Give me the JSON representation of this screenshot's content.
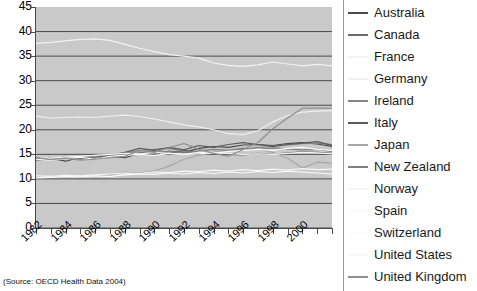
{
  "chart_data": {
    "type": "line",
    "title": "",
    "xlabel": "",
    "ylabel": "",
    "ylim": [
      0,
      45
    ],
    "ytick_step": 5,
    "yticks": [
      "0",
      "5",
      "10",
      "15",
      "20",
      "25",
      "30",
      "35",
      "40",
      "45"
    ],
    "grid": true,
    "grid_axis": "y",
    "plot_background": "#c9c9c9",
    "legend_position": "right",
    "x": [
      1982,
      1983,
      1984,
      1985,
      1986,
      1987,
      1988,
      1989,
      1990,
      1991,
      1992,
      1993,
      1994,
      1995,
      1996,
      1997,
      1998,
      1999,
      2000,
      2001,
      2002
    ],
    "xtick_labels": [
      "1982",
      "1984",
      "1986",
      "1988",
      "1990",
      "1992",
      "1994",
      "1996",
      "1998",
      "2000"
    ],
    "xtick_label_years": [
      1982,
      1984,
      1986,
      1988,
      1990,
      1992,
      1994,
      1996,
      1998,
      2000
    ],
    "xtick_label_rotation": -45,
    "series": [
      {
        "name": "Australia",
        "color": "#4a4a4a",
        "values": [
          14.0,
          14.2,
          13.6,
          14.4,
          14.1,
          14.6,
          14.3,
          15.2,
          15.0,
          15.6,
          15.4,
          16.2,
          16.6,
          16.4,
          16.9,
          17.0,
          16.8,
          17.2,
          17.4,
          17.1,
          16.6
        ]
      },
      {
        "name": "Canada",
        "color": "#6b6b6b",
        "values": [
          13.9,
          14.0,
          14.2,
          14.5,
          14.6,
          14.8,
          15.1,
          15.3,
          15.6,
          15.2,
          15.8,
          15.4,
          15.1,
          15.0,
          14.9,
          15.2,
          15.0,
          15.3,
          15.5,
          15.4,
          15.2
        ]
      },
      {
        "name": "France",
        "color": "#f2f2f2",
        "values": [
          37.6,
          37.8,
          38.1,
          38.4,
          38.5,
          38.2,
          37.4,
          36.6,
          35.9,
          35.3,
          35.0,
          34.6,
          33.6,
          33.1,
          32.9,
          33.2,
          33.8,
          33.4,
          33.0,
          33.3,
          33.0
        ]
      },
      {
        "name": "Germany",
        "color": "#efefef",
        "values": [
          22.8,
          22.4,
          22.5,
          22.6,
          22.5,
          22.8,
          23.0,
          22.7,
          22.2,
          21.6,
          21.0,
          20.6,
          20.0,
          19.2,
          19.0,
          19.8,
          21.6,
          22.9,
          23.6,
          23.8,
          23.9
        ]
      },
      {
        "name": "Ireland",
        "color": "#858585",
        "values": [
          14.2,
          14.0,
          14.6,
          14.4,
          14.8,
          15.0,
          15.3,
          15.7,
          16.0,
          16.2,
          15.6,
          15.2,
          15.4,
          15.7,
          16.0,
          16.4,
          16.6,
          16.9,
          17.2,
          17.3,
          17.0
        ]
      },
      {
        "name": "Italy",
        "color": "#5a5a5a",
        "values": [
          14.1,
          14.0,
          14.3,
          14.1,
          14.5,
          14.7,
          15.4,
          16.2,
          15.8,
          16.4,
          15.9,
          16.8,
          16.4,
          17.0,
          17.4,
          17.0,
          16.6,
          17.0,
          17.3,
          17.6,
          16.8
        ]
      },
      {
        "name": "Japan",
        "color": "#a8a8a8",
        "values": [
          10.5,
          10.4,
          10.6,
          10.4,
          10.6,
          10.8,
          11.4,
          11.2,
          11.6,
          12.6,
          14.0,
          14.8,
          15.4,
          15.8,
          16.2,
          16.0,
          15.4,
          14.2,
          12.2,
          13.4,
          13.2
        ]
      },
      {
        "name": "New Zealand",
        "color": "#7f7f7f",
        "values": [
          13.8,
          14.1,
          14.4,
          14.0,
          14.6,
          14.9,
          15.2,
          15.0,
          15.4,
          15.6,
          15.3,
          15.7,
          16.0,
          15.8,
          16.2,
          16.0,
          16.3,
          16.1,
          15.9,
          16.0,
          15.6
        ]
      },
      {
        "name": "Norway",
        "color": "#f5f5f5",
        "values": [
          14.3,
          14.2,
          14.5,
          14.6,
          14.8,
          15.0,
          15.2,
          15.1,
          15.4,
          15.2,
          15.0,
          15.1,
          15.3,
          15.2,
          15.0,
          15.1,
          15.0,
          15.2,
          15.4,
          15.3,
          15.1
        ]
      },
      {
        "name": "Spain",
        "color": "#fafafa",
        "values": [
          14.0,
          13.8,
          14.2,
          14.4,
          14.0,
          14.6,
          14.8,
          15.0,
          14.8,
          15.2,
          15.0,
          15.4,
          15.2,
          15.6,
          15.8,
          16.0,
          15.8,
          16.2,
          16.4,
          16.0,
          15.8
        ]
      },
      {
        "name": "Switzerland",
        "color": "#fbfbfb",
        "values": [
          10.2,
          10.3,
          10.5,
          10.4,
          10.6,
          10.5,
          10.8,
          11.0,
          10.9,
          11.2,
          11.0,
          11.3,
          11.1,
          11.4,
          11.2,
          11.5,
          11.3,
          11.6,
          11.4,
          11.2,
          11.0
        ]
      },
      {
        "name": "United States",
        "color": "#f7f7f7",
        "values": [
          10.6,
          10.5,
          10.7,
          10.6,
          10.8,
          11.0,
          11.2,
          11.1,
          11.4,
          11.3,
          11.6,
          11.5,
          11.8,
          11.6,
          11.9,
          11.7,
          12.0,
          11.8,
          12.1,
          11.9,
          12.0
        ]
      },
      {
        "name": "United Kingdom",
        "color": "#8f8f8f",
        "values": [
          14.4,
          13.9,
          14.2,
          13.8,
          14.0,
          14.3,
          14.6,
          15.8,
          15.4,
          16.4,
          17.2,
          16.0,
          15.2,
          14.6,
          16.0,
          17.4,
          20.2,
          22.4,
          24.4,
          24.4,
          24.4
        ]
      }
    ],
    "source_note": "(Source: OECD Health Data 2004)"
  },
  "legend": {
    "items": [
      {
        "label": "Australia",
        "color": "#4a4a4a"
      },
      {
        "label": "Canada",
        "color": "#6b6b6b"
      },
      {
        "label": "France",
        "color": "#f2f2f2"
      },
      {
        "label": "Germany",
        "color": "#efefef"
      },
      {
        "label": "Ireland",
        "color": "#858585"
      },
      {
        "label": "Italy",
        "color": "#5a5a5a"
      },
      {
        "label": "Japan",
        "color": "#a8a8a8"
      },
      {
        "label": "New Zealand",
        "color": "#7f7f7f"
      },
      {
        "label": "Norway",
        "color": "#f5f5f5"
      },
      {
        "label": "Spain",
        "color": "#fafafa"
      },
      {
        "label": "Switzerland",
        "color": "#fbfbfb"
      },
      {
        "label": "United States",
        "color": "#f7f7f7"
      },
      {
        "label": "United Kingdom",
        "color": "#8f8f8f"
      }
    ]
  }
}
